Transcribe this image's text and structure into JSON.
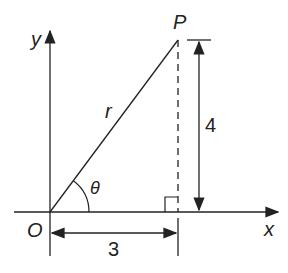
{
  "diagram": {
    "type": "right-triangle-polar-coordinates",
    "colors": {
      "stroke": "#222222",
      "background": "#ffffff"
    },
    "axes": {
      "x_label": "x",
      "y_label": "y",
      "origin_label": "O"
    },
    "point": {
      "label": "P"
    },
    "hypotenuse": {
      "label": "r"
    },
    "angle": {
      "label": "θ"
    },
    "dimensions": {
      "horizontal": {
        "label": "3"
      },
      "vertical": {
        "label": "4"
      }
    }
  }
}
